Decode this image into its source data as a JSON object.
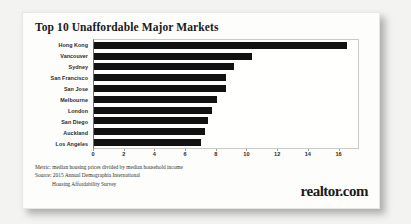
{
  "chart_data": {
    "type": "bar",
    "orientation": "horizontal",
    "title": "Top 10 Unaffordable Major Markets",
    "categories": [
      "Hong Kong",
      "Vancouver",
      "Sydney",
      "San Francisco",
      "San Jose",
      "Melbourne",
      "London",
      "San Diego",
      "Auckland",
      "Los Angeles"
    ],
    "values": [
      16.5,
      10.3,
      9.1,
      8.6,
      8.6,
      8.0,
      7.7,
      7.4,
      7.2,
      7.0
    ],
    "xlabel": "",
    "ylabel": "",
    "xlim": [
      0,
      17.2
    ],
    "xticks": [
      0,
      2,
      4,
      6,
      8,
      10,
      12,
      14,
      16
    ],
    "xtick_labels": [
      "0",
      "2",
      "4",
      "6",
      "8",
      "10",
      "12",
      "14",
      "16"
    ],
    "grid": false,
    "legend": false,
    "bar_color": "#121212"
  },
  "notes": {
    "metric": "Metric:  median housing prices divided by median household income",
    "source": "Source:  2015 Annual Demographia International",
    "source_cont": "Housing Affordability Survey"
  },
  "branding": {
    "logo_text": "realtor.com"
  }
}
